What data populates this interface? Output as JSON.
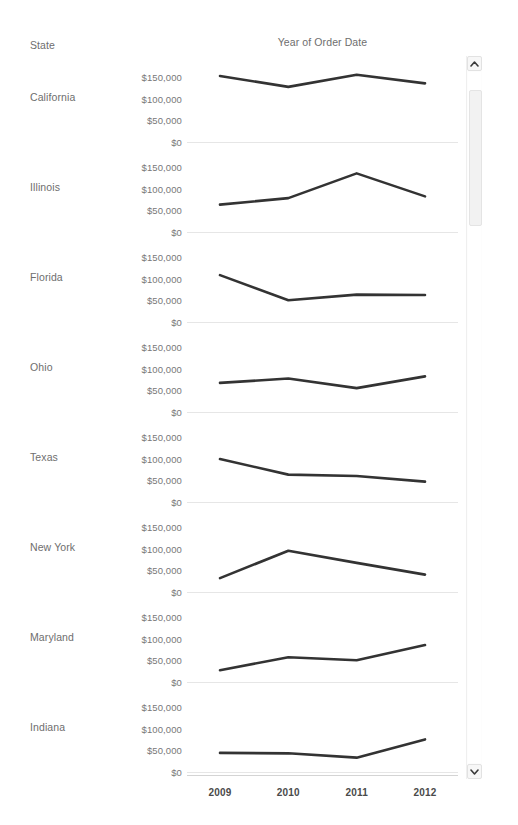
{
  "header": {
    "row_field_label": "State",
    "chart_title": "Year of Order Date"
  },
  "axis": {
    "y_ticks": [
      "$150,000",
      "$100,000",
      "$50,000",
      "$0"
    ],
    "y_tick_values": [
      150000,
      100000,
      50000,
      0
    ],
    "x_ticks": [
      "2009",
      "2010",
      "2011",
      "2012"
    ]
  },
  "scrollbar": {
    "up_icon": "chevron-up-icon",
    "down_icon": "chevron-down-icon"
  },
  "colors": {
    "line": "#333333",
    "gridline": "#e6e6e6",
    "axis_text": "#6e6e6e",
    "tick_text": "#777777",
    "background": "#ffffff"
  },
  "chart_data": {
    "type": "line",
    "title": "Year of Order Date",
    "xlabel": "",
    "ylabel": "",
    "x": [
      2009,
      2010,
      2011,
      2012
    ],
    "ylim": [
      0,
      175000
    ],
    "grid": true,
    "legend": "none",
    "small_multiples_by": "State",
    "panels": [
      {
        "label": "California",
        "values": [
          152000,
          127000,
          155000,
          135000
        ]
      },
      {
        "label": "Illinois",
        "values": [
          63000,
          78000,
          135000,
          82000
        ]
      },
      {
        "label": "Florida",
        "values": [
          108000,
          50000,
          63000,
          62000
        ]
      },
      {
        "label": "Ohio",
        "values": [
          67000,
          77000,
          55000,
          82000
        ]
      },
      {
        "label": "Texas",
        "values": [
          99000,
          63000,
          60000,
          47000
        ]
      },
      {
        "label": "New York",
        "values": [
          32000,
          95000,
          67000,
          40000
        ]
      },
      {
        "label": "Maryland",
        "values": [
          27000,
          57000,
          50000,
          85000
        ]
      },
      {
        "label": "Indiana",
        "values": [
          44000,
          43000,
          33000,
          75000
        ]
      }
    ]
  }
}
